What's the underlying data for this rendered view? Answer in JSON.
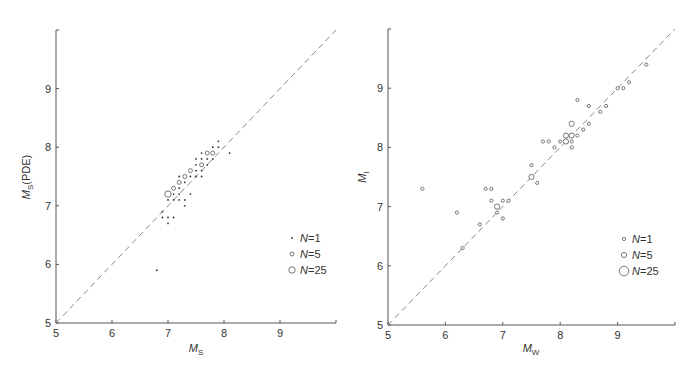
{
  "chart_data": [
    {
      "type": "scatter",
      "title": "",
      "xlabel": "M_S",
      "xlabel_main": "M",
      "xlabel_sub": "S",
      "ylabel": "M_S(PDE)",
      "ylabel_main": "M",
      "ylabel_sub": "S",
      "ylabel_suffix": "(PDE)",
      "xlim": [
        5,
        10
      ],
      "ylim": [
        5,
        10
      ],
      "xticks": [
        "5",
        "6",
        "7",
        "8",
        "9"
      ],
      "yticks": [
        "5",
        "6",
        "7",
        "8",
        "9"
      ],
      "grid": false,
      "reference_line": "y = x (dashed)",
      "legend_position": "lower right",
      "legend": [
        {
          "label": "N=1",
          "n_label": "N",
          "value": "1",
          "marker": "small dot"
        },
        {
          "label": "N=5",
          "n_label": "N",
          "value": "5",
          "marker": "small circle"
        },
        {
          "label": "N=25",
          "n_label": "N",
          "value": "25",
          "marker": "large circle"
        }
      ],
      "series": [
        {
          "name": "N=1",
          "points": [
            [
              6.8,
              5.9
            ],
            [
              6.9,
              6.8
            ],
            [
              7.0,
              6.8
            ],
            [
              7.1,
              6.8
            ],
            [
              7.0,
              6.7
            ],
            [
              6.9,
              6.9
            ],
            [
              7.0,
              7.1
            ],
            [
              7.1,
              7.1
            ],
            [
              7.1,
              7.2
            ],
            [
              7.2,
              7.1
            ],
            [
              7.3,
              7.1
            ],
            [
              7.3,
              7.0
            ],
            [
              7.2,
              7.2
            ],
            [
              7.4,
              7.2
            ],
            [
              7.2,
              7.3
            ],
            [
              7.3,
              7.4
            ],
            [
              7.2,
              7.5
            ],
            [
              7.4,
              7.5
            ],
            [
              7.5,
              7.5
            ],
            [
              7.6,
              7.5
            ],
            [
              7.5,
              7.6
            ],
            [
              7.6,
              7.6
            ],
            [
              7.5,
              7.7
            ],
            [
              7.5,
              7.8
            ],
            [
              7.6,
              7.8
            ],
            [
              7.7,
              7.7
            ],
            [
              7.6,
              7.9
            ],
            [
              7.7,
              7.8
            ],
            [
              7.8,
              7.8
            ],
            [
              7.8,
              8.0
            ],
            [
              7.9,
              8.0
            ],
            [
              7.9,
              8.1
            ],
            [
              8.1,
              7.9
            ]
          ]
        },
        {
          "name": "N=5",
          "points": [
            [
              7.1,
              7.3
            ],
            [
              7.2,
              7.4
            ],
            [
              7.3,
              7.5
            ],
            [
              7.4,
              7.6
            ],
            [
              7.6,
              7.7
            ],
            [
              7.7,
              7.9
            ],
            [
              7.8,
              7.9
            ]
          ]
        },
        {
          "name": "N=25",
          "points": [
            [
              7.0,
              7.2
            ]
          ]
        }
      ]
    },
    {
      "type": "scatter",
      "title": "",
      "xlabel": "M_W",
      "xlabel_main": "M",
      "xlabel_sub": "W",
      "ylabel": "M_I",
      "ylabel_main": "M",
      "ylabel_sub": "I",
      "ylabel_suffix": "",
      "xlim": [
        5,
        10
      ],
      "ylim": [
        5,
        10
      ],
      "xticks": [
        "5",
        "6",
        "7",
        "8",
        "9"
      ],
      "yticks": [
        "5",
        "6",
        "7",
        "8",
        "9"
      ],
      "grid": false,
      "reference_line": "y = x (dashed)",
      "legend_position": "lower right",
      "legend": [
        {
          "label": "N=1",
          "n_label": "N",
          "value": "1",
          "marker": "small circle"
        },
        {
          "label": "N=5",
          "n_label": "N",
          "value": "5",
          "marker": "medium circle"
        },
        {
          "label": "N=25",
          "n_label": "N",
          "value": "25",
          "marker": "large circle"
        }
      ],
      "series": [
        {
          "name": "N=1",
          "points": [
            [
              5.6,
              7.3
            ],
            [
              6.2,
              6.9
            ],
            [
              6.3,
              6.3
            ],
            [
              6.6,
              6.7
            ],
            [
              6.7,
              7.3
            ],
            [
              6.8,
              7.3
            ],
            [
              6.8,
              7.1
            ],
            [
              6.9,
              6.9
            ],
            [
              7.0,
              7.1
            ],
            [
              7.1,
              7.1
            ],
            [
              7.0,
              6.8
            ],
            [
              7.5,
              7.7
            ],
            [
              7.6,
              7.4
            ],
            [
              7.7,
              8.1
            ],
            [
              7.8,
              8.1
            ],
            [
              7.9,
              8.0
            ],
            [
              8.0,
              8.1
            ],
            [
              8.2,
              8.1
            ],
            [
              8.2,
              8.0
            ],
            [
              8.3,
              8.8
            ],
            [
              8.3,
              8.2
            ],
            [
              8.4,
              8.3
            ],
            [
              8.5,
              8.7
            ],
            [
              8.5,
              8.4
            ],
            [
              8.7,
              8.6
            ],
            [
              8.8,
              8.7
            ],
            [
              9.0,
              9.0
            ],
            [
              9.1,
              9.0
            ],
            [
              9.2,
              9.1
            ],
            [
              9.5,
              9.4
            ]
          ]
        },
        {
          "name": "N=5",
          "points": [
            [
              6.9,
              7.0
            ],
            [
              7.5,
              7.5
            ],
            [
              8.1,
              8.2
            ],
            [
              8.2,
              8.4
            ],
            [
              8.2,
              8.2
            ],
            [
              8.1,
              8.1
            ]
          ]
        }
      ]
    }
  ]
}
